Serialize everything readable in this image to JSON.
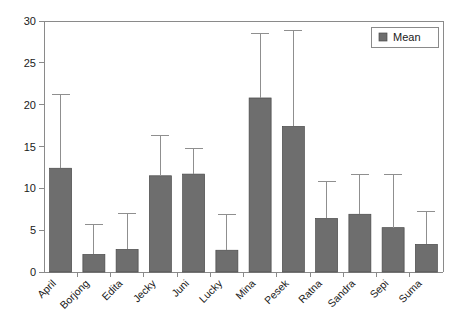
{
  "chart_data": {
    "type": "bar",
    "title": "",
    "xlabel": "",
    "ylabel": "",
    "ylim": [
      0,
      30
    ],
    "yticks": [
      0,
      5,
      10,
      15,
      20,
      25,
      30
    ],
    "ytick_labels": [
      "0",
      "5",
      "10",
      "15",
      "20",
      "25",
      "30"
    ],
    "grid": false,
    "legend": {
      "position": "top-right",
      "entries": [
        {
          "label": "Mean",
          "color": "#6e6e6e"
        }
      ]
    },
    "categories": [
      "April",
      "Borjong",
      "Edita",
      "Jecky",
      "Juni",
      "Lucky",
      "Mina",
      "Pesek",
      "Ratna",
      "Sandra",
      "Sepi",
      "Suma"
    ],
    "series": [
      {
        "name": "Mean",
        "color": "#6e6e6e",
        "values": [
          12.4,
          2.1,
          2.7,
          11.5,
          11.7,
          2.6,
          20.8,
          17.4,
          6.4,
          6.9,
          5.3,
          3.3
        ],
        "error_upper": [
          21.2,
          5.7,
          7.0,
          16.3,
          14.8,
          6.9,
          28.5,
          28.9,
          10.8,
          11.6,
          11.6,
          7.2
        ]
      }
    ]
  },
  "axes": {
    "error_bar_color": "#8f8f8f",
    "axis_color": "#8a8a8a"
  }
}
